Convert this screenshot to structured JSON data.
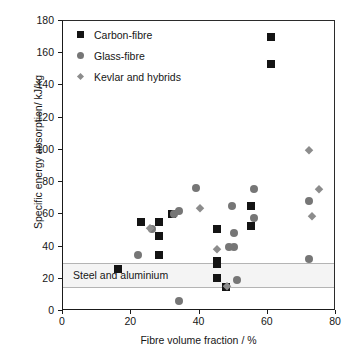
{
  "chart_data": {
    "type": "scatter",
    "title": "",
    "xlabel": "Fibre volume fraction / %",
    "ylabel": "Specific energy absorption/ kJ/kg",
    "xlim": [
      0,
      80
    ],
    "ylim": [
      0,
      180
    ],
    "xticks": [
      0,
      20,
      40,
      60,
      80
    ],
    "yticks": [
      0,
      20,
      40,
      60,
      80,
      100,
      120,
      140,
      160,
      180
    ],
    "grid": false,
    "legend_position": "top-left",
    "annotations": [
      {
        "name": "steel-and-aluminium-band",
        "label": "Steel and aluminium",
        "y_range": [
          14,
          30
        ],
        "color": "#f4f4f4",
        "border_color": "#b4b4b4"
      }
    ],
    "series": [
      {
        "name": "Carbon-fibre",
        "marker": "square",
        "color": "#141414",
        "points": [
          [
            16,
            26
          ],
          [
            22.8,
            55
          ],
          [
            28.2,
            55
          ],
          [
            28.2,
            46.5
          ],
          [
            28.2,
            35
          ],
          [
            32,
            60
          ],
          [
            45,
            51
          ],
          [
            45,
            31
          ],
          [
            45,
            29
          ],
          [
            45,
            20.5
          ],
          [
            47.8,
            15
          ],
          [
            55,
            65
          ],
          [
            55,
            53
          ],
          [
            61,
            170
          ],
          [
            61,
            153.5
          ]
        ]
      },
      {
        "name": "Glass-fibre",
        "marker": "circle",
        "color": "#767676",
        "points": [
          [
            22,
            35
          ],
          [
            26,
            51
          ],
          [
            32.5,
            60
          ],
          [
            34,
            62
          ],
          [
            34,
            6.5
          ],
          [
            39,
            76.5
          ],
          [
            48.5,
            40
          ],
          [
            49.5,
            65
          ],
          [
            50,
            39.5
          ],
          [
            50,
            48.5
          ],
          [
            51,
            19.5
          ],
          [
            56,
            75.5
          ],
          [
            56,
            58
          ],
          [
            72,
            68
          ],
          [
            72,
            32
          ]
        ]
      },
      {
        "name": "Kevlar and hybrids",
        "marker": "diamond",
        "color": "#8c8c8c",
        "points": [
          [
            25.5,
            51.5
          ],
          [
            40,
            64
          ],
          [
            45,
            38.5
          ],
          [
            48,
            15.5
          ],
          [
            72,
            100
          ],
          [
            73,
            59
          ],
          [
            75,
            76
          ]
        ]
      }
    ]
  },
  "legend": {
    "entries": [
      {
        "label": "Carbon-fibre",
        "marker": "carbon"
      },
      {
        "label": "Glass-fibre",
        "marker": "glass"
      },
      {
        "label": "Kevlar and hybrids",
        "marker": "kevlar"
      }
    ]
  }
}
